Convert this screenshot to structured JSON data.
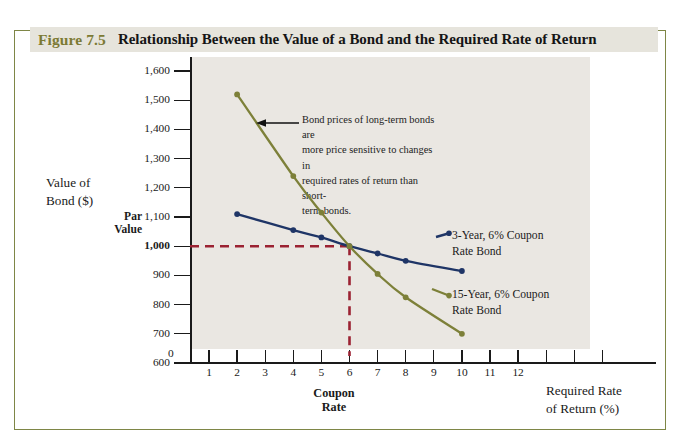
{
  "figure": {
    "number": "Figure 7.5",
    "title": "Relationship Between the Value of a Bond and the Required Rate of Return",
    "number_color": "#7c7a34",
    "banner_color": "#e6e4dc",
    "frame_color": "#7e8646"
  },
  "chart_data": {
    "type": "line",
    "title": "Relationship Between the Value of a Bond and the Required Rate of Return",
    "xlabel": "Required Rate of Return (%)",
    "ylabel": "Value of Bond ($)",
    "xlim": [
      0,
      14
    ],
    "ylim": [
      550,
      1650
    ],
    "grid": false,
    "legend_position": "inline-right",
    "x_tick_labels": [
      "1",
      "2",
      "3",
      "4",
      "5",
      "6",
      "7",
      "8",
      "9",
      "10",
      "11",
      "12"
    ],
    "x_ticks_unlabeled": [
      13,
      14,
      15
    ],
    "y_tick_labels": [
      "1,600",
      "1,500",
      "1,400",
      "1,300",
      "1,200",
      "1,100",
      "1,000",
      "900",
      "800",
      "700",
      "600"
    ],
    "y_tick_values": [
      1600,
      1500,
      1400,
      1300,
      1200,
      1100,
      1000,
      900,
      800,
      700,
      600
    ],
    "y_origin_label": "0",
    "series": [
      {
        "name": "3-Year, 6% Coupon Rate Bond",
        "label_line1": "3-Year, 6% Coupon",
        "label_line2": "Rate Bond",
        "color": "#1f3566",
        "x": [
          2,
          4,
          5,
          6,
          7,
          8,
          10
        ],
        "values": [
          1110,
          1055,
          1030,
          1000,
          975,
          950,
          915
        ]
      },
      {
        "name": "15-Year, 6% Coupon Rate Bond",
        "label_line1": "15-Year, 6% Coupon",
        "label_line2": "Rate Bond",
        "color": "#7d8039",
        "x": [
          2,
          4,
          5,
          6,
          7,
          8,
          10
        ],
        "values": [
          1520,
          1240,
          1115,
          1000,
          905,
          825,
          700
        ]
      }
    ],
    "reference_lines": [
      {
        "name": "par-value-line",
        "orientation": "horizontal",
        "value": 1000,
        "color": "#9b2232",
        "style": "dashed"
      },
      {
        "name": "coupon-rate-line",
        "orientation": "vertical",
        "value": 6,
        "color": "#9b2232",
        "style": "dashed"
      }
    ],
    "annotations": [
      {
        "name": "long-term-sensitivity-note",
        "text": "Bond prices of long-term bonds are more price sensitive to changes in required rates of return than short-term bonds.",
        "line1": "Bond prices of long-term bonds are",
        "line2": "more price sensitive to changes in",
        "line3": "required rates of return than short-",
        "line4": "term bonds.",
        "arrow": "points-left-to-15-year-curve"
      }
    ],
    "axis_tags": [
      {
        "name": "par-value-tag",
        "line1": "Par",
        "line2": "Value",
        "at_value": 1000
      },
      {
        "name": "coupon-rate-tag",
        "line1": "Coupon",
        "line2": "Rate",
        "at_value": 6
      }
    ]
  }
}
